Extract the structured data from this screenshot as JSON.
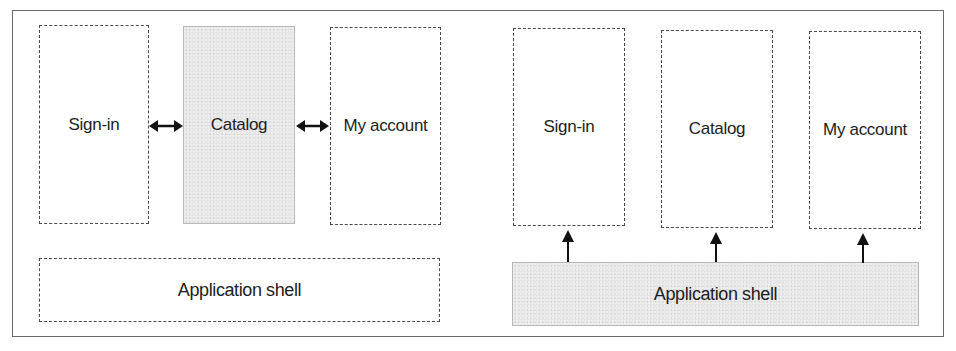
{
  "diagram": {
    "left_panel": {
      "modules": [
        {
          "label": "Sign-in",
          "style": "dashed"
        },
        {
          "label": "Catalog",
          "style": "shaded"
        },
        {
          "label": "My account",
          "style": "dashed"
        }
      ],
      "shell": {
        "label": "Application shell",
        "style": "dashed"
      },
      "connectors": [
        {
          "from": "Sign-in",
          "to": "Catalog",
          "type": "bidirectional-arrow"
        },
        {
          "from": "Catalog",
          "to": "My account",
          "type": "bidirectional-arrow"
        }
      ]
    },
    "right_panel": {
      "modules": [
        {
          "label": "Sign-in",
          "style": "dashed"
        },
        {
          "label": "Catalog",
          "style": "dashed"
        },
        {
          "label": "My account",
          "style": "dashed"
        }
      ],
      "shell": {
        "label": "Application shell",
        "style": "shaded"
      },
      "connectors": [
        {
          "from": "Application shell",
          "to": "Sign-in",
          "type": "up-arrow"
        },
        {
          "from": "Application shell",
          "to": "Catalog",
          "type": "up-arrow"
        },
        {
          "from": "Application shell",
          "to": "My account",
          "type": "up-arrow"
        }
      ]
    },
    "colors": {
      "shaded_fill": "#e6e6e6",
      "dash_stroke": "#4a4a4a",
      "arrow": "#111111",
      "frame": "#6a6a6a"
    }
  }
}
